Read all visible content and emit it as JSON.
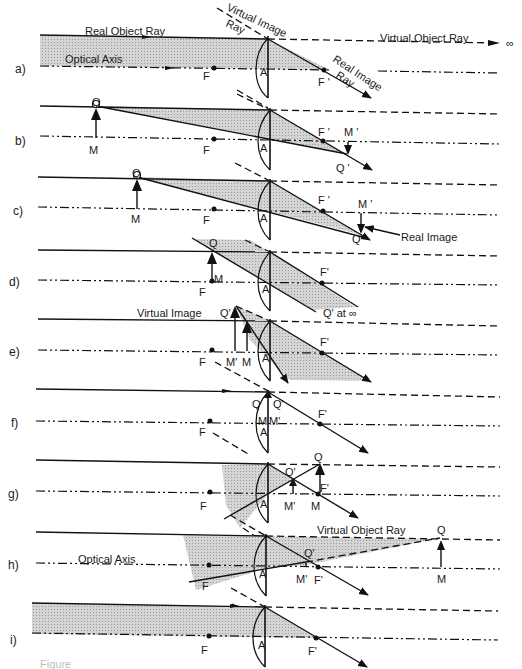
{
  "figure": {
    "colors": {
      "ink": "#111111",
      "shade": "#c8c8c8",
      "background": "#ffffff"
    }
  },
  "panels": [
    {
      "id": "a",
      "label": "a)",
      "y_top": 36,
      "y_axis": 68,
      "texts": [
        {
          "t": "Real Object Ray",
          "x": 85,
          "y": 35
        },
        {
          "t": "Optical Axis",
          "x": 65,
          "y": 63
        },
        {
          "t": "F",
          "x": 203,
          "y": 80
        },
        {
          "t": "A",
          "x": 260,
          "y": 76
        },
        {
          "t": "F '",
          "x": 318,
          "y": 86
        },
        {
          "t": "Virtual Object Ray",
          "x": 380,
          "y": 42
        },
        {
          "t": "∞",
          "x": 506,
          "y": 47
        }
      ],
      "rotated_texts": [
        {
          "t": "Virtual Image",
          "x": 226,
          "y": 10,
          "angle": 25
        },
        {
          "t": "Ray",
          "x": 225,
          "y": 26,
          "angle": 25
        },
        {
          "t": "Real Image",
          "x": 332,
          "y": 61,
          "angle": 33
        },
        {
          "t": "Ray",
          "x": 335,
          "y": 77,
          "angle": 33
        }
      ]
    },
    {
      "id": "b",
      "label": "b)",
      "y_top": 107,
      "y_axis": 140,
      "texts": [
        {
          "t": "Q",
          "x": 92,
          "y": 106
        },
        {
          "t": "M",
          "x": 89,
          "y": 154
        },
        {
          "t": "F",
          "x": 203,
          "y": 154
        },
        {
          "t": "A",
          "x": 260,
          "y": 152
        },
        {
          "t": "F '",
          "x": 318,
          "y": 136
        },
        {
          "t": "M '",
          "x": 344,
          "y": 136
        },
        {
          "t": "Q '",
          "x": 336,
          "y": 172
        }
      ]
    },
    {
      "id": "c",
      "label": "c)",
      "y_top": 177,
      "y_axis": 208,
      "texts": [
        {
          "t": "Q",
          "x": 132,
          "y": 177
        },
        {
          "t": "M",
          "x": 131,
          "y": 223
        },
        {
          "t": "F",
          "x": 203,
          "y": 224
        },
        {
          "t": "A",
          "x": 260,
          "y": 222
        },
        {
          "t": "F '",
          "x": 318,
          "y": 204
        },
        {
          "t": "M '",
          "x": 358,
          "y": 208
        },
        {
          "t": "Q'",
          "x": 352,
          "y": 243
        },
        {
          "t": "Real Image",
          "x": 401,
          "y": 241
        }
      ]
    },
    {
      "id": "d",
      "label": "d)",
      "y_top": 250,
      "y_axis": 281,
      "texts": [
        {
          "t": "Q",
          "x": 209,
          "y": 247
        },
        {
          "t": "M",
          "x": 214,
          "y": 283
        },
        {
          "t": "F",
          "x": 199,
          "y": 296
        },
        {
          "t": "A",
          "x": 262,
          "y": 293
        },
        {
          "t": "F'",
          "x": 320,
          "y": 276
        },
        {
          "t": "Q' at ∞",
          "x": 323,
          "y": 317
        }
      ]
    },
    {
      "id": "e",
      "label": "e)",
      "y_top": 319,
      "y_axis": 351,
      "texts": [
        {
          "t": "Virtual Image",
          "x": 137,
          "y": 317
        },
        {
          "t": "Q'",
          "x": 220,
          "y": 317
        },
        {
          "t": "F",
          "x": 199,
          "y": 366
        },
        {
          "t": "M'",
          "x": 226,
          "y": 366
        },
        {
          "t": "M",
          "x": 242,
          "y": 366
        },
        {
          "t": "A",
          "x": 262,
          "y": 362
        },
        {
          "t": "F'",
          "x": 320,
          "y": 346
        }
      ]
    },
    {
      "id": "f",
      "label": "f)",
      "y_top": 389,
      "y_axis": 422,
      "texts": [
        {
          "t": "Q",
          "x": 252,
          "y": 408
        },
        {
          "t": "Q'",
          "x": 273,
          "y": 408
        },
        {
          "t": "M",
          "x": 258,
          "y": 425
        },
        {
          "t": "M'",
          "x": 269,
          "y": 425
        },
        {
          "t": "A",
          "x": 260,
          "y": 436
        },
        {
          "t": "F'",
          "x": 318,
          "y": 418
        },
        {
          "t": "F",
          "x": 199,
          "y": 436
        }
      ]
    },
    {
      "id": "g",
      "label": "g)",
      "y_top": 462,
      "y_axis": 493,
      "texts": [
        {
          "t": "Q",
          "x": 314,
          "y": 461
        },
        {
          "t": "Q'",
          "x": 285,
          "y": 476
        },
        {
          "t": "F'",
          "x": 320,
          "y": 492
        },
        {
          "t": "F",
          "x": 200,
          "y": 510
        },
        {
          "t": "A",
          "x": 260,
          "y": 508
        },
        {
          "t": "M'",
          "x": 284,
          "y": 510
        },
        {
          "t": "M",
          "x": 311,
          "y": 510
        }
      ]
    },
    {
      "id": "h",
      "label": "h)",
      "y_top": 535,
      "y_axis": 566,
      "texts": [
        {
          "t": "Virtual Object Ray",
          "x": 317,
          "y": 534
        },
        {
          "t": "Q",
          "x": 437,
          "y": 534
        },
        {
          "t": "Optical Axis",
          "x": 78,
          "y": 563
        },
        {
          "t": "Q'",
          "x": 304,
          "y": 557
        },
        {
          "t": "A",
          "x": 259,
          "y": 578
        },
        {
          "t": "M'",
          "x": 296,
          "y": 583
        },
        {
          "t": "F'",
          "x": 314,
          "y": 584
        },
        {
          "t": "M",
          "x": 437,
          "y": 583
        },
        {
          "t": "F",
          "x": 202,
          "y": 590
        }
      ]
    },
    {
      "id": "i",
      "label": "i)",
      "y_top": 603,
      "y_axis": 640,
      "texts": [
        {
          "t": "F",
          "x": 201,
          "y": 654
        },
        {
          "t": "A",
          "x": 258,
          "y": 649
        },
        {
          "t": "F'",
          "x": 308,
          "y": 655
        }
      ]
    }
  ],
  "footer": {
    "caption": "Figure"
  }
}
